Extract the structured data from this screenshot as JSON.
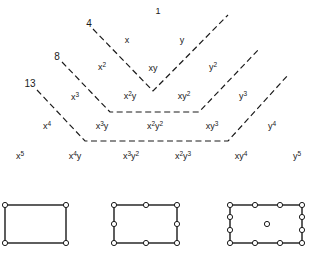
{
  "diagram": {
    "type": "pascal-triangle-monomials-with-element-node-patterns",
    "stroke_color": "#1a1a1a",
    "background": "#ffffff",
    "rows": [
      {
        "degree": 0,
        "terms": [
          {
            "id": "t00",
            "base": "1",
            "x": 158,
            "y": 11
          }
        ]
      },
      {
        "degree": 1,
        "terms": [
          {
            "id": "t10",
            "parts": [
              [
                "x",
                ""
              ]
            ],
            "x": 127,
            "y": 40
          },
          {
            "id": "t11",
            "parts": [
              [
                "y",
                ""
              ]
            ],
            "x": 182,
            "y": 40
          }
        ]
      },
      {
        "degree": 2,
        "terms": [
          {
            "id": "t20",
            "parts": [
              [
                "x",
                "2"
              ]
            ],
            "x": 102,
            "y": 67
          },
          {
            "id": "t21",
            "parts": [
              [
                "xy",
                ""
              ]
            ],
            "x": 153,
            "y": 68
          },
          {
            "id": "t22",
            "parts": [
              [
                "y",
                "2"
              ]
            ],
            "x": 213,
            "y": 67
          }
        ]
      },
      {
        "degree": 3,
        "terms": [
          {
            "id": "t30",
            "parts": [
              [
                "x",
                "3"
              ]
            ],
            "x": 75,
            "y": 97
          },
          {
            "id": "t31",
            "parts": [
              [
                "x",
                "2"
              ],
              [
                "y",
                ""
              ]
            ],
            "x": 130,
            "y": 96
          },
          {
            "id": "t32",
            "parts": [
              [
                "xy",
                "2"
              ]
            ],
            "x": 184,
            "y": 96
          },
          {
            "id": "t33",
            "parts": [
              [
                "y",
                "3"
              ]
            ],
            "x": 243,
            "y": 96
          }
        ]
      },
      {
        "degree": 4,
        "terms": [
          {
            "id": "t40",
            "parts": [
              [
                "x",
                "4"
              ]
            ],
            "x": 47,
            "y": 126
          },
          {
            "id": "t41",
            "parts": [
              [
                "x",
                "3"
              ],
              [
                "y",
                ""
              ]
            ],
            "x": 102,
            "y": 126
          },
          {
            "id": "t42",
            "parts": [
              [
                "x",
                "2"
              ],
              [
                "y",
                "2"
              ]
            ],
            "x": 155,
            "y": 126
          },
          {
            "id": "t43",
            "parts": [
              [
                "xy",
                "3"
              ]
            ],
            "x": 212,
            "y": 126
          },
          {
            "id": "t44",
            "parts": [
              [
                "y",
                "4"
              ]
            ],
            "x": 272,
            "y": 126
          }
        ]
      },
      {
        "degree": 5,
        "terms": [
          {
            "id": "t50",
            "parts": [
              [
                "x",
                "5"
              ]
            ],
            "x": 20,
            "y": 156
          },
          {
            "id": "t51",
            "parts": [
              [
                "x",
                "4"
              ],
              [
                "y",
                ""
              ]
            ],
            "x": 75,
            "y": 156
          },
          {
            "id": "t52",
            "parts": [
              [
                "x",
                "3"
              ],
              [
                "y",
                "2"
              ]
            ],
            "x": 131,
            "y": 156
          },
          {
            "id": "t53",
            "parts": [
              [
                "x",
                "2"
              ],
              [
                "y",
                "3"
              ]
            ],
            "x": 183,
            "y": 156
          },
          {
            "id": "t54",
            "parts": [
              [
                "xy",
                "4"
              ]
            ],
            "x": 241,
            "y": 156
          },
          {
            "id": "t55",
            "parts": [
              [
                "y",
                "5"
              ]
            ],
            "x": 297,
            "y": 156
          }
        ]
      }
    ],
    "boundaries": [
      {
        "label": "4",
        "label_x": 89,
        "label_y": 24,
        "points": "93,29 153,91 228,15"
      },
      {
        "label": "8",
        "label_x": 57,
        "label_y": 57,
        "points": "62,62 110,112 199,112 260,48"
      },
      {
        "label": "13",
        "label_x": 30,
        "label_y": 84,
        "points": "37,90 85,141 228,141 288,75"
      }
    ],
    "elements": [
      {
        "name": "4-node",
        "node_count": 4,
        "rect": {
          "x1": 5,
          "y1": 205,
          "x2": 66,
          "y2": 243
        },
        "nodes": [
          [
            5,
            205
          ],
          [
            66,
            205
          ],
          [
            5,
            243
          ],
          [
            66,
            243
          ]
        ]
      },
      {
        "name": "8-node",
        "node_count": 8,
        "rect": {
          "x1": 114,
          "y1": 205,
          "x2": 177,
          "y2": 243
        },
        "nodes": [
          [
            114,
            205
          ],
          [
            146,
            205
          ],
          [
            177,
            205
          ],
          [
            114,
            224
          ],
          [
            177,
            224
          ],
          [
            114,
            243
          ],
          [
            146,
            243
          ],
          [
            177,
            243
          ]
        ]
      },
      {
        "name": "13-node",
        "node_count": 13,
        "rect": {
          "x1": 230,
          "y1": 205,
          "x2": 302,
          "y2": 243
        },
        "nodes": [
          [
            230,
            205
          ],
          [
            255,
            205
          ],
          [
            280,
            205
          ],
          [
            302,
            205
          ],
          [
            230,
            217
          ],
          [
            302,
            217
          ],
          [
            230,
            230
          ],
          [
            302,
            230
          ],
          [
            230,
            243
          ],
          [
            255,
            243
          ],
          [
            280,
            243
          ],
          [
            302,
            243
          ],
          [
            267,
            224
          ]
        ]
      }
    ]
  }
}
